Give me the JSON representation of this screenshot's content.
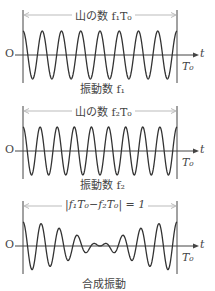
{
  "panels": [
    {
      "id": "wave1",
      "top_label": "山の数 f₁T₀",
      "bottom_label": "振動数 f₁",
      "cycles": 8,
      "type": "single"
    },
    {
      "id": "wave2",
      "top_label": "山の数 f₂T₀",
      "bottom_label": "振動数 f₂",
      "cycles": 9,
      "type": "single"
    },
    {
      "id": "beat",
      "top_label": "|f₁T₀−f₂T₀| = 1",
      "bottom_label": "合成振動",
      "cycles1": 8,
      "cycles2": 9,
      "type": "sum"
    }
  ],
  "axis": {
    "origin_label": "O",
    "t_label": "t",
    "end_label": "T₀"
  },
  "colors": {
    "wave": "#333333",
    "axis": "#444444",
    "bracket": "#bbbbbb"
  }
}
